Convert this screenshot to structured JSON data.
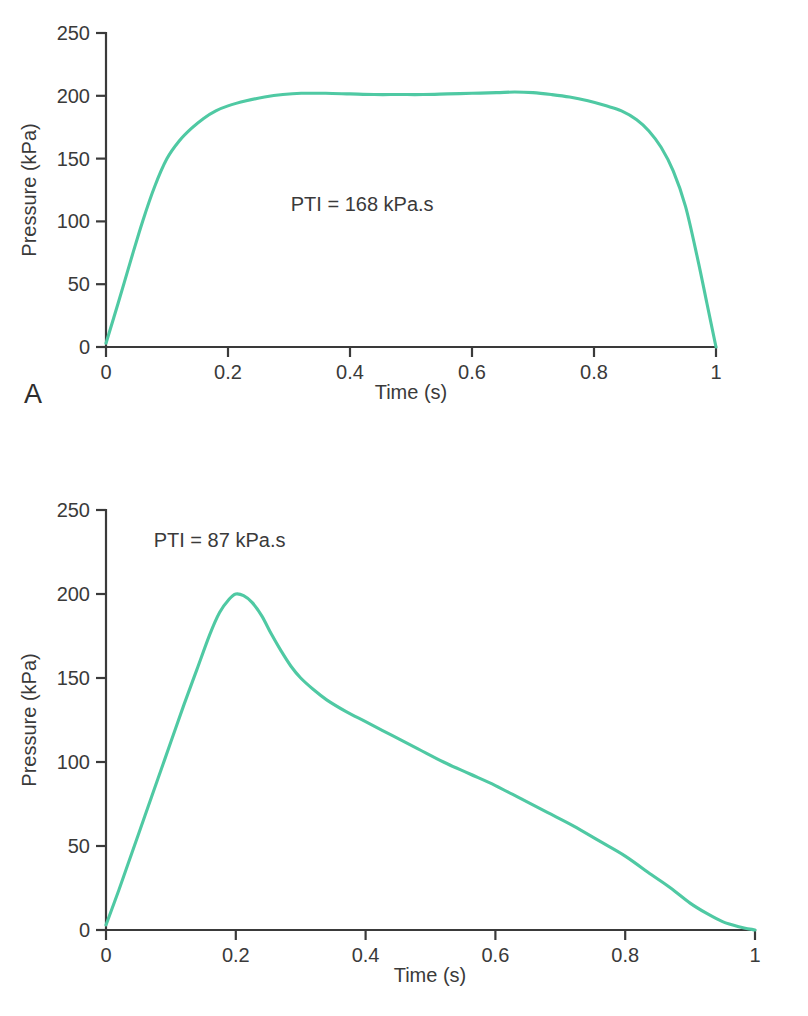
{
  "figure": {
    "background_color": "#ffffff",
    "curve_color": "#4FC9A3",
    "axis_color": "#3a3a3a",
    "text_color": "#3a3a3a"
  },
  "panels": [
    {
      "letter": "A",
      "annotation": "PTI = 168 kPa.s"
    },
    {
      "letter": "B",
      "annotation": "PTI = 87 kPa.s"
    }
  ],
  "chart_data": [
    {
      "type": "line",
      "panel": "A",
      "title": "",
      "xlabel": "Time (s)",
      "ylabel": "Pressure (kPa)",
      "xlim": [
        0,
        1
      ],
      "ylim": [
        0,
        250
      ],
      "xticks": [
        0,
        0.2,
        0.4,
        0.6,
        0.8,
        1
      ],
      "xticklabels": [
        "0",
        "0.2",
        "0.4",
        "0.6",
        "0.8",
        "1"
      ],
      "yticks": [
        0,
        50,
        100,
        150,
        200,
        250
      ],
      "yticklabels": [
        "0",
        "50",
        "100",
        "150",
        "200",
        "250"
      ],
      "grid": false,
      "legend": "none",
      "annotations": [
        {
          "text": "PTI = 168 kPa.s",
          "x": 0.42,
          "y": 108
        }
      ],
      "series": [
        {
          "name": "Square pressure waveform",
          "color": "#4FC9A3",
          "x": [
            0.0,
            0.02,
            0.04,
            0.06,
            0.08,
            0.1,
            0.12,
            0.14,
            0.16,
            0.18,
            0.2,
            0.23,
            0.26,
            0.29,
            0.32,
            0.36,
            0.4,
            0.44,
            0.48,
            0.52,
            0.56,
            0.6,
            0.64,
            0.67,
            0.7,
            0.73,
            0.76,
            0.79,
            0.82,
            0.845,
            0.87,
            0.89,
            0.91,
            0.93,
            0.95,
            0.97,
            0.985,
            1.0
          ],
          "y": [
            3,
            35,
            68,
            100,
            128,
            150,
            164,
            174,
            182,
            188,
            192,
            196,
            199,
            201,
            202,
            202,
            201.5,
            201,
            201,
            201,
            201.5,
            202,
            202.5,
            203,
            202.5,
            201,
            199,
            196,
            192,
            188,
            181,
            172,
            159,
            140,
            112,
            70,
            35,
            0
          ]
        }
      ]
    },
    {
      "type": "line",
      "panel": "B",
      "title": "",
      "xlabel": "Time (s)",
      "ylabel": "Pressure (kPa)",
      "xlim": [
        0,
        1
      ],
      "ylim": [
        0,
        250
      ],
      "xticks": [
        0,
        0.2,
        0.4,
        0.6,
        0.8,
        1
      ],
      "xticklabels": [
        "0",
        "0.2",
        "0.4",
        "0.6",
        "0.8",
        "1"
      ],
      "yticks": [
        0,
        50,
        100,
        150,
        200,
        250
      ],
      "yticklabels": [
        "0",
        "50",
        "100",
        "150",
        "200",
        "250"
      ],
      "grid": false,
      "legend": "none",
      "annotations": [
        {
          "text": "PTI = 87 kPa.s",
          "x": 0.175,
          "y": 228
        }
      ],
      "series": [
        {
          "name": "Peaked pressure waveform",
          "color": "#4FC9A3",
          "x": [
            0.0,
            0.02,
            0.04,
            0.06,
            0.08,
            0.1,
            0.12,
            0.14,
            0.16,
            0.175,
            0.19,
            0.2,
            0.212,
            0.225,
            0.24,
            0.255,
            0.27,
            0.285,
            0.3,
            0.32,
            0.34,
            0.37,
            0.4,
            0.44,
            0.48,
            0.52,
            0.56,
            0.6,
            0.64,
            0.68,
            0.72,
            0.76,
            0.8,
            0.84,
            0.87,
            0.9,
            0.925,
            0.95,
            0.975,
            1.0
          ],
          "y": [
            3,
            24,
            46,
            68,
            90,
            112,
            134,
            155,
            176,
            189,
            197,
            200,
            199,
            195,
            187,
            176,
            166,
            157,
            150,
            143,
            137,
            130,
            124,
            116,
            108,
            100,
            93,
            86,
            78,
            70,
            62,
            53,
            44,
            33,
            25,
            16,
            10,
            5,
            2,
            0
          ]
        }
      ]
    }
  ]
}
